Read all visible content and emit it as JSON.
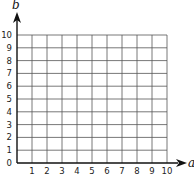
{
  "chart_data": {
    "type": "scatter",
    "title": "",
    "xlabel": "a",
    "ylabel": "b",
    "xlim": [
      0,
      10
    ],
    "ylim": [
      0,
      10
    ],
    "grid": true,
    "x_ticks": [
      "1",
      "2",
      "3",
      "4",
      "5",
      "6",
      "7",
      "8",
      "9",
      "10"
    ],
    "y_ticks": [
      "0",
      "1",
      "2",
      "3",
      "4",
      "5",
      "6",
      "7",
      "8",
      "9",
      "10"
    ],
    "series": [],
    "legend": null,
    "colors": {
      "axis": "#111111",
      "grid": "#555555",
      "text": "#222222",
      "background": "#ffffff"
    }
  }
}
